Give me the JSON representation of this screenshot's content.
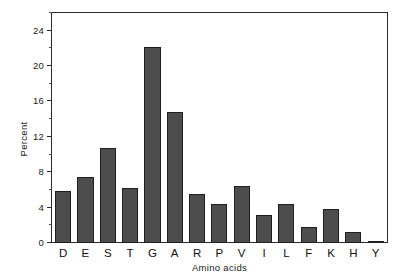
{
  "chart_data": {
    "type": "bar",
    "title": "",
    "subtitle": "",
    "xlabel": "Amino acids",
    "ylabel": "Percent",
    "categories": [
      "D",
      "E",
      "S",
      "T",
      "G",
      "A",
      "R",
      "P",
      "V",
      "I",
      "L",
      "F",
      "K",
      "H",
      "Y"
    ],
    "values": [
      5.9,
      7.5,
      10.7,
      6.2,
      22.2,
      14.8,
      5.5,
      4.4,
      6.4,
      3.2,
      4.4,
      1.8,
      3.9,
      1.3,
      0.2
    ],
    "series": [
      {
        "name": "Percent",
        "values": [
          5.9,
          7.5,
          10.7,
          6.2,
          22.2,
          14.8,
          5.5,
          4.4,
          6.4,
          3.2,
          4.4,
          1.8,
          3.9,
          1.3,
          0.2
        ]
      }
    ],
    "ylim": [
      0,
      26
    ],
    "yticks": [
      0,
      4,
      8,
      12,
      16,
      20,
      24
    ],
    "ytick_labels": [
      "0",
      "4",
      "8",
      "12",
      "16",
      "20",
      "24"
    ],
    "yminor_ticks": [
      2,
      6,
      10,
      14,
      18,
      22,
      26
    ],
    "grid": false,
    "legend": false,
    "legend_position": "none",
    "bar_color": "#4d4d4d",
    "bar_edge_color": "#1f1f1f",
    "axis_color": "#2b2b2b",
    "background_color": "#ffffff"
  }
}
